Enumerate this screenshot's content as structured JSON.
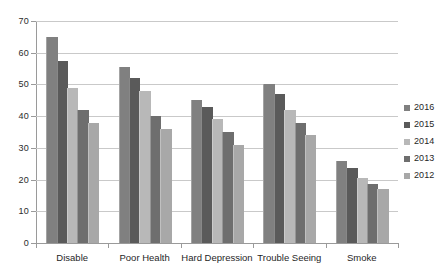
{
  "chart_data": {
    "type": "bar",
    "title": "",
    "xlabel": "",
    "ylabel": "",
    "ylim": [
      0,
      70
    ],
    "yticks": [
      0,
      10,
      20,
      30,
      40,
      50,
      60,
      70
    ],
    "ytick_labels": [
      "0",
      "10",
      "20",
      "30",
      "40",
      "50",
      "60",
      "70"
    ],
    "grid": true,
    "legend_position": "right",
    "categories": [
      "Disable",
      "Poor Health",
      "Hard Depression",
      "Trouble Seeing",
      "Smoke"
    ],
    "series": [
      {
        "name": "2016",
        "color": "#808080",
        "values": [
          65,
          55.5,
          45,
          50,
          26
        ]
      },
      {
        "name": "2015",
        "color": "#5a5a5a",
        "values": [
          57.5,
          52,
          43,
          47,
          23.5
        ]
      },
      {
        "name": "2014",
        "color": "#b8b8b8",
        "values": [
          49,
          48,
          39,
          42,
          20.5
        ]
      },
      {
        "name": "2013",
        "color": "#6e6e6e",
        "values": [
          42,
          40,
          35,
          38,
          18.5
        ]
      },
      {
        "name": "2012",
        "color": "#a8a8a8",
        "values": [
          38,
          36,
          31,
          34,
          17
        ]
      }
    ]
  },
  "colors": {
    "background": "#ffffff",
    "gridline": "#c9c9c9",
    "axis": "#9a9a9a",
    "text": "#1f1f1f"
  }
}
